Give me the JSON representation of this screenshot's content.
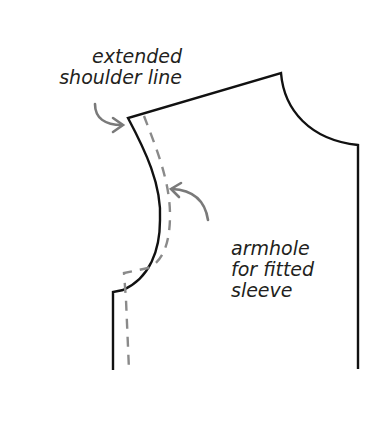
{
  "diagram": {
    "colors": {
      "outline": "#111111",
      "dashed": "#8a8a8a",
      "arrow": "#7a7a7a",
      "text": "#231f20",
      "background": "#ffffff"
    },
    "labels": {
      "shoulder": {
        "line1": "extended",
        "line2": "shoulder line"
      },
      "armhole": {
        "line1": "armhole",
        "line2": "for fitted",
        "line3": "sleeve"
      }
    }
  }
}
